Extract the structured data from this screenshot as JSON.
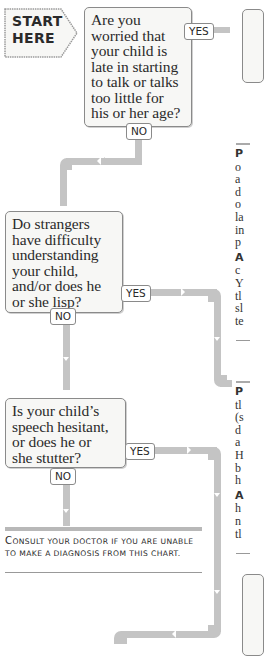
{
  "start": {
    "line1": "START",
    "line2": "HERE"
  },
  "questions": [
    {
      "id": "q1",
      "text": "Are you worried that your child is late in starting to talk or talks too little for his or her age?",
      "lines": [
        "Are you",
        "worried that",
        "your child is",
        "late in starting",
        "to talk or talks",
        "too little for",
        "his or her age?"
      ],
      "yes_label": "YES",
      "no_label": "NO"
    },
    {
      "id": "q2",
      "text": "Do strangers have difficulty understanding your child, and/or does he or she lisp?",
      "lines": [
        "Do strangers",
        "have difficulty",
        "understanding",
        "your child,",
        "and/or does he",
        "or she lisp?"
      ],
      "yes_label": "YES",
      "no_label": "NO"
    },
    {
      "id": "q3",
      "text": "Is your child's speech hesitant, or does he or she stutter?",
      "lines": [
        "Is your child’s",
        "speech hesitant,",
        "or does he or",
        "she stutter?"
      ],
      "yes_label": "YES",
      "no_label": "NO"
    }
  ],
  "footer": {
    "consult_first": "C",
    "consult_rest": "onsult your doctor if you are unable",
    "consult_line2": "to make a diagnosis from this chart."
  },
  "right_column": {
    "block1": {
      "bold": "P",
      "lines": [
        "o",
        "a",
        "d",
        "o",
        "la",
        "in",
        "p"
      ]
    },
    "block1b": {
      "bold": "A",
      "lines": [
        "c",
        "Y",
        "tl",
        "sl",
        "te"
      ]
    },
    "block2": {
      "bold": "P",
      "lines": [
        "tl",
        "(s",
        "d",
        "a",
        "H",
        "b",
        "h"
      ]
    },
    "block2b": {
      "bold": "A",
      "lines": [
        "h",
        "n",
        "tl"
      ]
    }
  },
  "colors": {
    "pipe": "#c4c4c4",
    "box_bg": "#f7f7f5",
    "border": "#8a8a8a",
    "text": "#2a2a2a"
  }
}
